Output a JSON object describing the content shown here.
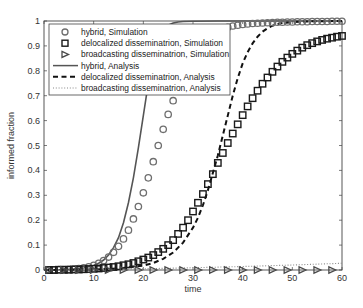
{
  "chart_data": {
    "type": "line",
    "title": "",
    "xlabel": "time",
    "ylabel": "informed fraction",
    "xlim": [
      0,
      60
    ],
    "ylim": [
      0,
      1
    ],
    "xticks": [
      0,
      10,
      20,
      30,
      40,
      50,
      60
    ],
    "yticks": [
      0,
      0.1,
      0.2,
      0.3,
      0.4,
      0.5,
      0.6,
      0.7,
      0.8,
      0.9,
      1
    ],
    "ytick_labels": [
      "0",
      "0.1",
      "0.2",
      "0.3",
      "0.4",
      "0.5",
      "0.6",
      "0.7",
      "0.8",
      "0.9",
      "1"
    ],
    "grid": false,
    "legend_position": "upper left",
    "series": [
      {
        "name": "hybrid, Simulation",
        "style": "marker",
        "marker": "circle",
        "color": "#6e6e6e",
        "x": [
          1,
          2,
          3,
          4,
          5,
          6,
          7,
          8,
          9,
          10,
          11,
          12,
          13,
          14,
          15,
          16,
          17,
          18,
          19,
          20,
          21,
          22,
          23,
          24,
          25,
          26,
          27,
          28,
          29,
          30,
          31,
          32,
          33,
          34,
          35,
          36,
          37,
          38,
          39,
          40,
          41,
          42,
          43,
          44,
          45,
          46,
          47,
          48,
          49,
          50,
          51,
          52,
          53,
          54,
          55,
          56,
          57,
          58,
          59,
          60
        ],
        "values": [
          0.001,
          0.001,
          0.002,
          0.002,
          0.003,
          0.004,
          0.006,
          0.009,
          0.013,
          0.019,
          0.027,
          0.038,
          0.052,
          0.071,
          0.095,
          0.125,
          0.16,
          0.205,
          0.255,
          0.31,
          0.37,
          0.435,
          0.5,
          0.565,
          0.625,
          0.68,
          0.74,
          0.79,
          0.84,
          0.88,
          0.905,
          0.925,
          0.94,
          0.952,
          0.962,
          0.969,
          0.975,
          0.98,
          0.983,
          0.986,
          0.988,
          0.99,
          0.991,
          0.992,
          0.993,
          0.994,
          0.995,
          0.995,
          0.996,
          0.996,
          0.997,
          0.997,
          0.997,
          0.998,
          0.998,
          0.998,
          0.998,
          0.999,
          0.999,
          0.999
        ]
      },
      {
        "name": "delocalized disseminatrion, Simulation",
        "style": "marker",
        "marker": "square",
        "color": "#1a1a1a",
        "x": [
          1,
          2,
          3,
          4,
          5,
          6,
          7,
          8,
          9,
          10,
          11,
          12,
          13,
          14,
          15,
          16,
          17,
          18,
          19,
          20,
          21,
          22,
          23,
          24,
          25,
          26,
          27,
          28,
          29,
          30,
          31,
          32,
          33,
          34,
          35,
          36,
          37,
          38,
          39,
          40,
          41,
          42,
          43,
          44,
          45,
          46,
          47,
          48,
          49,
          50,
          51,
          52,
          53,
          54,
          55,
          56,
          57,
          58,
          59,
          60
        ],
        "values": [
          0.0,
          0.0,
          0.001,
          0.001,
          0.001,
          0.002,
          0.002,
          0.003,
          0.004,
          0.005,
          0.006,
          0.008,
          0.01,
          0.012,
          0.015,
          0.019,
          0.023,
          0.028,
          0.035,
          0.042,
          0.05,
          0.06,
          0.072,
          0.085,
          0.1,
          0.12,
          0.145,
          0.17,
          0.2,
          0.235,
          0.27,
          0.305,
          0.345,
          0.385,
          0.43,
          0.47,
          0.51,
          0.548,
          0.585,
          0.622,
          0.657,
          0.69,
          0.72,
          0.748,
          0.773,
          0.796,
          0.817,
          0.836,
          0.853,
          0.868,
          0.881,
          0.893,
          0.903,
          0.911,
          0.918,
          0.924,
          0.929,
          0.933,
          0.937,
          0.94
        ]
      },
      {
        "name": "broadcasting disseminatrion, Simulation",
        "style": "marker",
        "marker": "triangle-right",
        "color": "#4a4a4a",
        "x": [
          1,
          4,
          7,
          10,
          13,
          16,
          19,
          22,
          25,
          28,
          31,
          34,
          37,
          40,
          43,
          46,
          49,
          52,
          55,
          58
        ],
        "values": [
          0,
          0,
          0,
          0,
          0,
          0,
          0,
          0,
          0,
          0,
          0,
          0,
          0,
          0,
          0,
          0,
          0,
          0,
          0,
          0
        ]
      },
      {
        "name": "hybrid, Analysis",
        "style": "solid",
        "color": "#555555",
        "x": [
          0,
          2,
          4,
          6,
          8,
          10,
          11,
          12,
          13,
          14,
          15,
          16,
          17,
          18,
          19,
          20,
          21,
          22,
          23,
          24,
          25,
          26,
          27,
          28,
          30,
          35,
          40,
          45,
          50,
          55,
          60
        ],
        "values": [
          0.0,
          0.001,
          0.002,
          0.004,
          0.008,
          0.018,
          0.027,
          0.04,
          0.06,
          0.09,
          0.13,
          0.19,
          0.27,
          0.37,
          0.49,
          0.62,
          0.75,
          0.86,
          0.93,
          0.965,
          0.983,
          0.992,
          0.996,
          0.998,
          0.999,
          1.0,
          1.0,
          1.0,
          1.0,
          1.0,
          1.0
        ]
      },
      {
        "name": "delocalized disseminatrion, Analysis",
        "style": "dashed",
        "color": "#111111",
        "x": [
          0,
          5,
          10,
          15,
          20,
          22,
          24,
          26,
          28,
          30,
          31,
          32,
          33,
          34,
          35,
          36,
          37,
          38,
          39,
          40,
          41,
          42,
          43,
          44,
          45,
          46,
          47,
          48,
          50,
          52,
          55,
          60
        ],
        "values": [
          0.0,
          0.001,
          0.002,
          0.006,
          0.018,
          0.028,
          0.045,
          0.07,
          0.11,
          0.17,
          0.21,
          0.26,
          0.32,
          0.39,
          0.46,
          0.54,
          0.62,
          0.7,
          0.77,
          0.83,
          0.875,
          0.91,
          0.937,
          0.957,
          0.971,
          0.981,
          0.988,
          0.992,
          0.996,
          0.998,
          0.999,
          1.0
        ]
      },
      {
        "name": "broadcasting disseminatrion, Analysis",
        "style": "dotted",
        "color": "#888888",
        "x": [
          0,
          10,
          20,
          30,
          40,
          50,
          60
        ],
        "values": [
          0.0,
          0.002,
          0.005,
          0.009,
          0.014,
          0.02,
          0.027
        ]
      }
    ]
  },
  "legend": {
    "entries": [
      {
        "label": "hybrid, Simulation",
        "symbol": "circle"
      },
      {
        "label": "delocalized disseminatrion, Simulation",
        "symbol": "square"
      },
      {
        "label": "broadcasting disseminatrion, Simulation",
        "symbol": "triangle-right"
      },
      {
        "label": "hybrid, Analysis",
        "symbol": "solid"
      },
      {
        "label": "delocalized disseminatrion, Analysis",
        "symbol": "dashed"
      },
      {
        "label": "broadcasting disseminatrion, Analysis",
        "symbol": "dotted"
      }
    ]
  },
  "layout": {
    "plot_left": 44,
    "plot_top": 21,
    "plot_right": 342,
    "plot_bottom": 270,
    "frame_color": "#444444"
  }
}
